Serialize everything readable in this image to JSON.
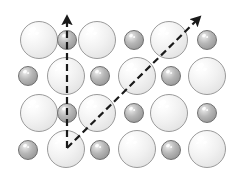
{
  "figure": {
    "background_color": "#ffffff",
    "width": 239,
    "height": 175
  },
  "legend": {
    "large_sphere_label": "large anion sphere",
    "small_sphere_label": "small cation sphere"
  },
  "colors": {
    "large_sphere_fill": "#efefef",
    "large_sphere_outline": "#9a9a9a",
    "small_sphere_fill": "#b0b0b0",
    "small_sphere_outline": "#6f6f6f",
    "vector_color": "#1a1a1a",
    "highlight": "#ffffff"
  },
  "lattice": {
    "rows": 4,
    "columns": 6,
    "pattern": "alternating-checkerboard",
    "large_radius": 19,
    "small_radius": 10,
    "atoms": [
      {
        "id": "a-r1c1",
        "type": "large",
        "cx": 39,
        "cy": 40,
        "r": 19
      },
      {
        "id": "a-r1c2",
        "type": "small",
        "cx": 67,
        "cy": 40,
        "r": 10
      },
      {
        "id": "a-r1c3",
        "type": "large",
        "cx": 97,
        "cy": 40,
        "r": 19
      },
      {
        "id": "a-r1c4",
        "type": "small",
        "cx": 134,
        "cy": 40,
        "r": 10
      },
      {
        "id": "a-r1c5",
        "type": "large",
        "cx": 169,
        "cy": 40,
        "r": 19
      },
      {
        "id": "a-r1c6",
        "type": "small",
        "cx": 207,
        "cy": 40,
        "r": 10
      },
      {
        "id": "a-r2c1",
        "type": "small",
        "cx": 28,
        "cy": 76,
        "r": 10
      },
      {
        "id": "a-r2c2",
        "type": "large",
        "cx": 66,
        "cy": 76,
        "r": 19
      },
      {
        "id": "a-r2c3",
        "type": "small",
        "cx": 100,
        "cy": 76,
        "r": 10
      },
      {
        "id": "a-r2c4",
        "type": "large",
        "cx": 137,
        "cy": 76,
        "r": 19
      },
      {
        "id": "a-r2c5",
        "type": "small",
        "cx": 171,
        "cy": 76,
        "r": 10
      },
      {
        "id": "a-r2c6",
        "type": "large",
        "cx": 207,
        "cy": 76,
        "r": 19
      },
      {
        "id": "a-r3c1",
        "type": "large",
        "cx": 39,
        "cy": 113,
        "r": 19
      },
      {
        "id": "a-r3c2",
        "type": "small",
        "cx": 67,
        "cy": 113,
        "r": 10
      },
      {
        "id": "a-r3c3",
        "type": "large",
        "cx": 97,
        "cy": 113,
        "r": 19
      },
      {
        "id": "a-r3c4",
        "type": "small",
        "cx": 134,
        "cy": 113,
        "r": 10
      },
      {
        "id": "a-r3c5",
        "type": "large",
        "cx": 169,
        "cy": 113,
        "r": 19
      },
      {
        "id": "a-r3c6",
        "type": "small",
        "cx": 207,
        "cy": 113,
        "r": 10
      },
      {
        "id": "a-r4c1",
        "type": "small",
        "cx": 28,
        "cy": 150,
        "r": 10
      },
      {
        "id": "a-r4c2",
        "type": "large",
        "cx": 66,
        "cy": 149,
        "r": 19
      },
      {
        "id": "a-r4c3",
        "type": "small",
        "cx": 100,
        "cy": 150,
        "r": 10
      },
      {
        "id": "a-r4c4",
        "type": "large",
        "cx": 137,
        "cy": 149,
        "r": 19
      },
      {
        "id": "a-r4c5",
        "type": "small",
        "cx": 171,
        "cy": 150,
        "r": 10
      },
      {
        "id": "a-r4c6",
        "type": "large",
        "cx": 207,
        "cy": 149,
        "r": 19
      }
    ]
  },
  "vectors": {
    "origin": {
      "x": 67,
      "y": 148
    },
    "items": [
      {
        "id": "vector-vertical",
        "name": "vertical-direction-vector",
        "from": {
          "x": 67,
          "y": 148
        },
        "to": {
          "x": 67,
          "y": 12
        },
        "style": "dashed",
        "arrowhead": "solid-triangle",
        "label": ""
      },
      {
        "id": "vector-diagonal",
        "name": "diagonal-direction-vector",
        "from": {
          "x": 67,
          "y": 148
        },
        "to": {
          "x": 203,
          "y": 14
        },
        "style": "dashed",
        "arrowhead": "solid-triangle",
        "label": ""
      }
    ],
    "line_width": 2.2,
    "dash_pattern": "7 4"
  }
}
